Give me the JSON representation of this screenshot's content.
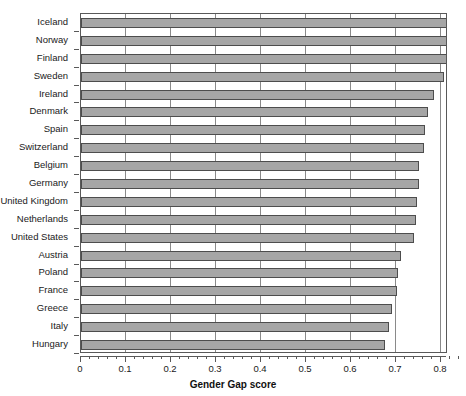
{
  "chart_data": {
    "type": "bar",
    "orientation": "horizontal",
    "title": "",
    "xlabel": "Gender Gap score",
    "ylabel": "",
    "xlim": [
      0,
      0.9
    ],
    "ylim": null,
    "grid": true,
    "legend": null,
    "xticks": [
      "0",
      "0.1",
      "0.2",
      "0.3",
      "0.4",
      "0.5",
      "0.6",
      "0.7",
      "0.8",
      "0.9"
    ],
    "xtick_values": [
      0,
      0.1,
      0.2,
      0.3,
      0.4,
      0.5,
      0.6,
      0.7,
      0.8,
      0.9
    ],
    "xtick_minor_step": 0.02,
    "categories": [
      "Iceland",
      "Norway",
      "Finland",
      "Sweden",
      "Ireland",
      "Denmark",
      "Spain",
      "Switzerland",
      "Belgium",
      "Germany",
      "United Kingdom",
      "Netherlands",
      "United States",
      "Austria",
      "Poland",
      "France",
      "Greece",
      "Italy",
      "Hungary"
    ],
    "values": [
      0.857,
      0.845,
      0.832,
      0.806,
      0.784,
      0.772,
      0.765,
      0.762,
      0.752,
      0.751,
      0.746,
      0.744,
      0.74,
      0.712,
      0.704,
      0.702,
      0.69,
      0.684,
      0.675
    ],
    "bar_fill_color": "#a6a6a6",
    "bar_edge_color": "#4d4d4d",
    "gridline_color": "#8a8a8a",
    "axis_color": "#595959",
    "background_color": "#ffffff"
  }
}
